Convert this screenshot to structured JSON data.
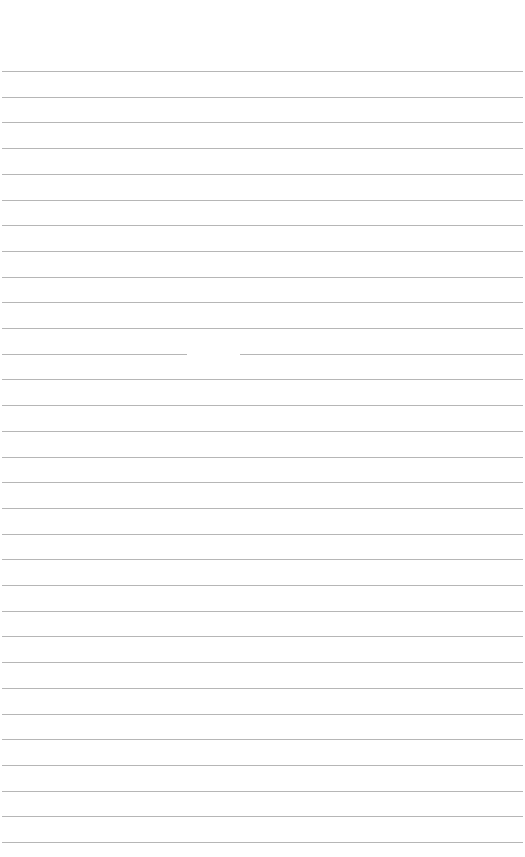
{
  "page": {
    "type": "lined-paper",
    "background": "#ffffff",
    "rule_color": "#a9a9a9",
    "first_rule_y": 71,
    "rule_spacing": 25.7,
    "rule_count": 31,
    "rule_left": 2,
    "rule_width": 521,
    "gaps": [
      {
        "rule_index": 11,
        "x_start": 187,
        "x_end": 240
      }
    ]
  }
}
